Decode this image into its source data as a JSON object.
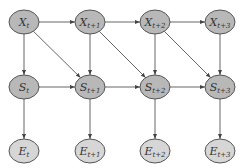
{
  "diagram": {
    "type": "dynamic-bayesian-network",
    "colors": {
      "background": "#ffffff",
      "node_fill_xs": "#b8b8b8",
      "node_fill_e": "#d6d6d6",
      "node_stroke": "#555555",
      "edge": "#666666"
    },
    "nodes": [
      {
        "id": "X0",
        "base": "X",
        "sub": "t",
        "cx": 24,
        "cy": 22
      },
      {
        "id": "X1",
        "base": "X",
        "sub": "t+1",
        "cx": 90,
        "cy": 22
      },
      {
        "id": "X2",
        "base": "X",
        "sub": "t+2",
        "cx": 155,
        "cy": 22
      },
      {
        "id": "X3",
        "base": "X",
        "sub": "t+3",
        "cx": 220,
        "cy": 22
      },
      {
        "id": "S0",
        "base": "S",
        "sub": "t",
        "cx": 24,
        "cy": 87
      },
      {
        "id": "S1",
        "base": "S",
        "sub": "t+1",
        "cx": 90,
        "cy": 87
      },
      {
        "id": "S2",
        "base": "S",
        "sub": "t+2",
        "cx": 155,
        "cy": 87
      },
      {
        "id": "S3",
        "base": "S",
        "sub": "t+3",
        "cx": 220,
        "cy": 87
      },
      {
        "id": "E0",
        "base": "E",
        "sub": "t",
        "cx": 24,
        "cy": 151
      },
      {
        "id": "E1",
        "base": "E",
        "sub": "t+1",
        "cx": 90,
        "cy": 151
      },
      {
        "id": "E2",
        "base": "E",
        "sub": "t+2",
        "cx": 155,
        "cy": 151
      },
      {
        "id": "E3",
        "base": "E",
        "sub": "t+3",
        "cx": 220,
        "cy": 151
      }
    ],
    "edges": [
      [
        "X0",
        "X1"
      ],
      [
        "X1",
        "X2"
      ],
      [
        "X2",
        "X3"
      ],
      [
        "S0",
        "S1"
      ],
      [
        "S1",
        "S2"
      ],
      [
        "S2",
        "S3"
      ],
      [
        "X0",
        "S0"
      ],
      [
        "X1",
        "S1"
      ],
      [
        "X2",
        "S2"
      ],
      [
        "X3",
        "S3"
      ],
      [
        "X0",
        "S1"
      ],
      [
        "X1",
        "S2"
      ],
      [
        "X2",
        "S3"
      ],
      [
        "S0",
        "E0"
      ],
      [
        "S1",
        "E1"
      ],
      [
        "S2",
        "E2"
      ],
      [
        "S3",
        "E3"
      ]
    ]
  }
}
